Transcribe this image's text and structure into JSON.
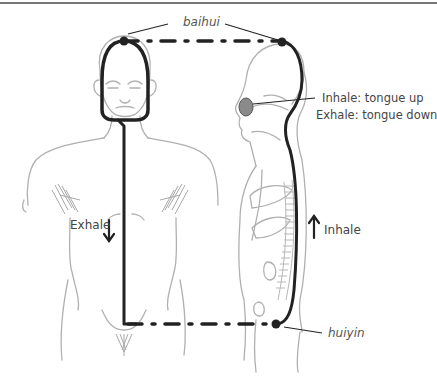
{
  "diagram": {
    "points": {
      "top": "baihui",
      "bottom": "huiyin"
    },
    "labels": {
      "tongue_line1": "Inhale: tongue up",
      "tongue_line2": "Exhale: tongue down",
      "front_flow": "Exhale",
      "back_flow": "Inhale"
    },
    "arrows": {
      "front": "down-arrow",
      "back": "up-arrow"
    },
    "colors": {
      "path": "#222222",
      "sketch": "#aaaaaa",
      "text": "#444444",
      "tongue": "#888888"
    }
  }
}
